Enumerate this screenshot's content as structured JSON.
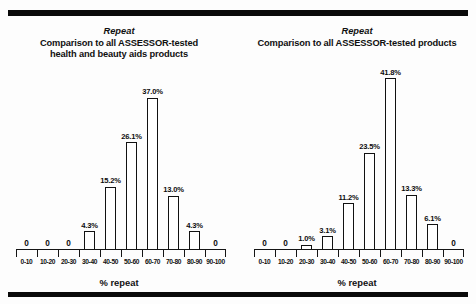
{
  "figure": {
    "background_color": "#fdfdfd",
    "rule_color": "#0a0a0a",
    "bar_outline_color": "#111111",
    "bar_fill_color": "#ffffff"
  },
  "charts": [
    {
      "eyebrow": "Repeat",
      "title_line_1": "Comparison to all ASSESSOR-tested",
      "title_line_2": "health and beauty aids products",
      "xlabel": "% repeat",
      "chart_data": {
        "type": "bar",
        "title": "Repeat — Comparison to all ASSESSOR-tested health and beauty aids products",
        "xlabel": "% repeat",
        "ylabel": "",
        "grid": false,
        "legend": "none",
        "ylim": [
          0,
          45
        ],
        "categories": [
          "0-10",
          "10-20",
          "20-30",
          "30-40",
          "40-50",
          "50-60",
          "60-70",
          "70-80",
          "80-90",
          "90-100"
        ],
        "values": [
          0,
          0,
          0,
          4.3,
          15.2,
          26.1,
          37.0,
          13.0,
          4.3,
          0
        ],
        "data_labels": [
          "0",
          "0",
          "0",
          "4.3%",
          "15.2%",
          "26.1%",
          "37.0%",
          "13.0%",
          "4.3%",
          "0"
        ]
      }
    },
    {
      "eyebrow": "Repeat",
      "title_line_1": "Comparison to all ASSESSOR-tested products",
      "title_line_2": "",
      "xlabel": "% repeat",
      "chart_data": {
        "type": "bar",
        "title": "Repeat — Comparison to all ASSESSOR-tested products",
        "xlabel": "% repeat",
        "ylabel": "",
        "grid": false,
        "legend": "none",
        "ylim": [
          0,
          45
        ],
        "categories": [
          "0-10",
          "10-20",
          "20-30",
          "30-40",
          "40-50",
          "50-60",
          "60-70",
          "70-80",
          "80-90",
          "90-100"
        ],
        "values": [
          0,
          0,
          1.0,
          3.1,
          11.2,
          23.5,
          41.8,
          13.3,
          6.1,
          0
        ],
        "data_labels": [
          "0",
          "0",
          "1.0%",
          "3.1%",
          "11.2%",
          "23.5%",
          "41.8%",
          "13.3%",
          "6.1%",
          "0"
        ]
      }
    }
  ]
}
